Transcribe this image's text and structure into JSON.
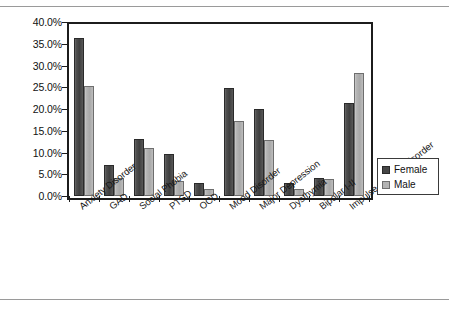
{
  "chart_data": {
    "type": "bar",
    "title": "",
    "subtitle": "",
    "xlabel": "",
    "ylabel": "",
    "ylim": [
      0,
      40
    ],
    "ytick_labels": [
      "40.0%",
      "35.0%",
      "30.0%",
      "25.0%",
      "20.0%",
      "15.0%",
      "10.0%",
      "5.0%",
      "0.0%"
    ],
    "ytick_values": [
      40,
      35,
      30,
      25,
      20,
      15,
      10,
      5,
      0
    ],
    "grid": false,
    "legend_position": "right",
    "categories": [
      "Anxiety Disorder",
      "GAD",
      "Social Phobia",
      "PTSD",
      "OCD",
      "Mood Disorder",
      "Major Depression",
      "Dysthymia",
      "Bipolar I-II",
      "Impulse Control Disorder"
    ],
    "series": [
      {
        "name": "Female",
        "color": "#464646",
        "values": [
          36.3,
          7.1,
          13.0,
          9.7,
          3.0,
          24.8,
          20.0,
          3.0,
          4.2,
          21.3
        ]
      },
      {
        "name": "Male",
        "color": "#b2b2b2",
        "values": [
          25.3,
          4.1,
          11.1,
          3.5,
          1.6,
          17.2,
          12.9,
          1.6,
          3.9,
          28.2
        ]
      }
    ]
  },
  "legend": {
    "items": [
      {
        "label": "Female",
        "swatch": "female"
      },
      {
        "label": "Male",
        "swatch": "male"
      }
    ]
  }
}
